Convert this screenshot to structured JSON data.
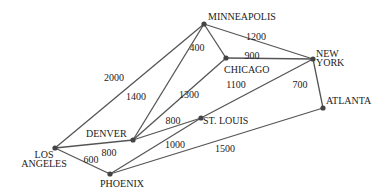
{
  "diagram": {
    "type": "weighted-undirected-graph",
    "nodes": [
      {
        "id": "minneapolis",
        "label_lines": [
          "MINNEAPOLIS"
        ],
        "x": 204,
        "y": 24,
        "lx": 208,
        "ly": 20,
        "anchor": "start"
      },
      {
        "id": "chicago",
        "label_lines": [
          "CHICAGO"
        ],
        "x": 226,
        "y": 58,
        "lx": 224,
        "ly": 73,
        "anchor": "start"
      },
      {
        "id": "new_york",
        "label_lines": [
          "NEW",
          "YORK"
        ],
        "x": 313,
        "y": 59,
        "lx": 316,
        "ly": 57,
        "anchor": "start"
      },
      {
        "id": "atlanta",
        "label_lines": [
          "ATLANTA"
        ],
        "x": 323,
        "y": 108,
        "lx": 326,
        "ly": 104,
        "anchor": "start"
      },
      {
        "id": "st_louis",
        "label_lines": [
          "ST. LOUIS"
        ],
        "x": 201,
        "y": 118,
        "lx": 203,
        "ly": 124,
        "anchor": "start"
      },
      {
        "id": "denver",
        "label_lines": [
          "DENVER"
        ],
        "x": 133,
        "y": 140,
        "lx": 86,
        "ly": 137,
        "anchor": "start"
      },
      {
        "id": "los_angeles",
        "label_lines": [
          "LOS",
          "ANGELES"
        ],
        "x": 55,
        "y": 148,
        "lx": 44,
        "ly": 158,
        "anchor": "middle"
      },
      {
        "id": "phoenix",
        "label_lines": [
          "PHOENIX"
        ],
        "x": 110,
        "y": 174,
        "lx": 122,
        "ly": 187,
        "anchor": "middle"
      }
    ],
    "edges": [
      {
        "from": "los_angeles",
        "to": "minneapolis",
        "weight": "2000",
        "wx": 114,
        "wy": 81
      },
      {
        "from": "denver",
        "to": "minneapolis",
        "weight": "1400",
        "wx": 136,
        "wy": 100
      },
      {
        "from": "minneapolis",
        "to": "chicago",
        "weight": "400",
        "wx": 197,
        "wy": 51
      },
      {
        "from": "minneapolis",
        "to": "new_york",
        "weight": "1200",
        "wx": 256,
        "wy": 40
      },
      {
        "from": "chicago",
        "to": "new_york",
        "weight": "900",
        "wx": 252,
        "wy": 59
      },
      {
        "from": "denver",
        "to": "chicago",
        "weight": "1300",
        "wx": 189,
        "wy": 98
      },
      {
        "from": "st_louis",
        "to": "new_york",
        "weight": "1100",
        "wx": 236,
        "wy": 88
      },
      {
        "from": "new_york",
        "to": "atlanta",
        "weight": "700",
        "wx": 300,
        "wy": 88
      },
      {
        "from": "denver",
        "to": "st_louis",
        "weight": "800",
        "wx": 173,
        "wy": 124
      },
      {
        "from": "los_angeles",
        "to": "denver",
        "weight": "800",
        "wx": 109,
        "wy": 156
      },
      {
        "from": "los_angeles",
        "to": "phoenix",
        "weight": "600",
        "wx": 91,
        "wy": 163
      },
      {
        "from": "phoenix",
        "to": "st_louis",
        "weight": "1000",
        "wx": 175,
        "wy": 148
      },
      {
        "from": "phoenix",
        "to": "atlanta",
        "weight": "1500",
        "wx": 225,
        "wy": 152
      }
    ]
  }
}
